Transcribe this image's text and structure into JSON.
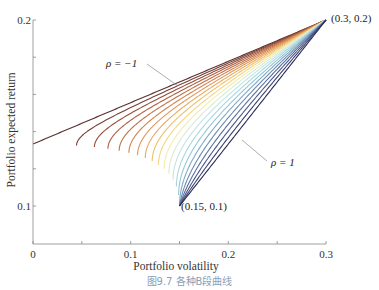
{
  "chart_data": {
    "type": "line",
    "title": "",
    "xlabel": "Portfolio volatility",
    "ylabel": "Portfolio expected return",
    "xlim": [
      0,
      0.3
    ],
    "ylim": [
      0.07,
      0.2
    ],
    "x_ticks": [
      0,
      0.1,
      0.2,
      0.3
    ],
    "x_tick_labels": [
      "0",
      "0.1",
      "0.2",
      "0.3"
    ],
    "x_minor_ticks": [
      0.05,
      0.15,
      0.25
    ],
    "y_ticks": [
      0.1,
      0.2
    ],
    "y_tick_labels": [
      "0.1",
      "0.2"
    ],
    "y_minor_ticks": [
      0.125,
      0.15,
      0.175
    ],
    "grid": false,
    "legend": "none",
    "assets": [
      {
        "volatility": 0.15,
        "return": 0.1
      },
      {
        "volatility": 0.3,
        "return": 0.2
      }
    ],
    "series_description": "Two-asset portfolio curves for correlation rho from -1 to 1 in steps of 0.1 (21 curves), colored dark brown (rho=-1) through orange, yellow, light cyan to dark navy (rho=1); each curve runs from (0.15, 0.1) to (0.3, 0.2). Only the efficient (upper) part of each curve is drawn, starting at its minimum-variance point.",
    "rho_values": [
      -1,
      -0.9,
      -0.8,
      -0.7,
      -0.6,
      -0.5,
      -0.4,
      -0.3,
      -0.2,
      -0.1,
      0,
      0.1,
      0.2,
      0.3,
      0.4,
      0.5,
      0.6,
      0.7,
      0.8,
      0.9,
      1
    ],
    "series": [
      {
        "name": "rho = -1",
        "start": {
          "volatility": 0.0,
          "return": 0.1333
        },
        "end": {
          "volatility": 0.3,
          "return": 0.2
        }
      },
      {
        "name": "rho = 1",
        "start": {
          "volatility": 0.15,
          "return": 0.1
        },
        "end": {
          "volatility": 0.3,
          "return": 0.2
        }
      }
    ],
    "annotations": [
      {
        "text": "(0.3, 0.2)",
        "x": 0.3,
        "y": 0.2
      },
      {
        "text": "(0.15, 0.1)",
        "x": 0.15,
        "y": 0.1
      },
      {
        "text": "ρ = −1",
        "points_to": "rho=-1 curve"
      },
      {
        "text": "ρ = 1",
        "points_to": "rho=1 curve"
      }
    ],
    "plot_params": {
      "sigma1": 0.15,
      "mu1": 0.1,
      "sigma2": 0.3,
      "mu2": 0.2,
      "n_samples": 120
    }
  },
  "labels": {
    "xlabel": "Portfolio volatility",
    "ylabel": "Portfolio expected return",
    "anno_top": "(0.3, 0.2)",
    "anno_bottom": "(0.15, 0.1)",
    "rho_neg": "ρ = −1",
    "rho_pos": "ρ = 1"
  },
  "ticks": {
    "x0": "0",
    "x1": "0.1",
    "x2": "0.2",
    "x3": "0.3",
    "y1": "0.1",
    "y2": "0.2"
  },
  "caption": "图9.7   各种B段曲线",
  "colors": {
    "axis": "#888888",
    "leader": "#8a8a8a",
    "rho_neg_color": "#5a3030",
    "rho_pos_color": "#2c2c5a"
  }
}
